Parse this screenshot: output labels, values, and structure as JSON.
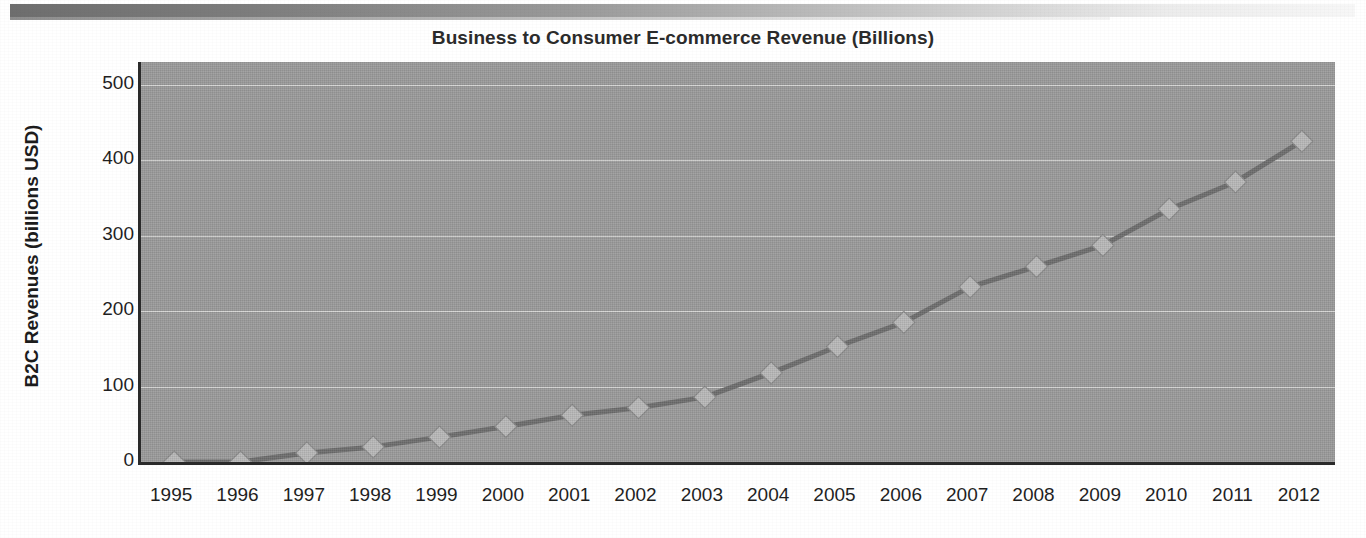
{
  "chart_data": {
    "type": "line",
    "title": "Business to Consumer E-commerce Revenue (Billions)",
    "xlabel": "",
    "ylabel": "B2C Revenues (billions USD)",
    "categories": [
      "1995",
      "1996",
      "1997",
      "1998",
      "1999",
      "2000",
      "2001",
      "2002",
      "2003",
      "2004",
      "2005",
      "2006",
      "2007",
      "2008",
      "2009",
      "2010",
      "2011",
      "2012"
    ],
    "values": [
      0,
      0,
      12,
      20,
      33,
      47,
      62,
      72,
      86,
      118,
      153,
      185,
      232,
      259,
      287,
      335,
      371,
      425
    ],
    "series": [
      {
        "name": "B2C Revenues",
        "values": [
          0,
          0,
          12,
          20,
          33,
          47,
          62,
          72,
          86,
          118,
          153,
          185,
          232,
          259,
          287,
          335,
          371,
          425
        ]
      }
    ],
    "ytick_labels": [
      "0",
      "100",
      "200",
      "300",
      "400",
      "500"
    ],
    "ytick_values": [
      0,
      100,
      200,
      300,
      400,
      500
    ],
    "ylim": [
      0,
      530
    ],
    "grid": true,
    "legend": null,
    "marker": "diamond",
    "plot_background_color": "#9b9b9b",
    "line_color": "#6d6d6d",
    "marker_color": "#b9b9b9",
    "gridline_color": "#ddddda",
    "axis_color": "#2a2a2a"
  }
}
